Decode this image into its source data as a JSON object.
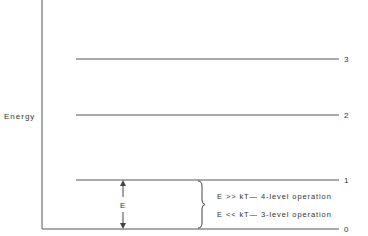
{
  "diagram": {
    "axis_label": "Energy",
    "levels": [
      {
        "label": "3"
      },
      {
        "label": "2"
      },
      {
        "label": "1"
      },
      {
        "label": "0"
      }
    ],
    "gap_label": "E",
    "conditions": [
      "E >> kT— 4-level operation",
      "E << kT— 3-level operation"
    ],
    "line_color": "#555555"
  }
}
